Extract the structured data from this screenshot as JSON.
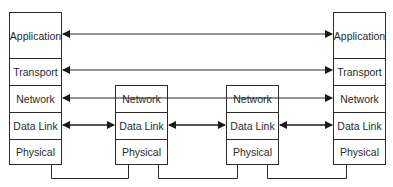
{
  "diagram": {
    "type": "protocol-stack-routing",
    "colors": {
      "line": "#2a2a2a",
      "text": "#2a2a2a",
      "background": "#ffffff"
    },
    "end_hosts": {
      "left": {
        "layers": [
          "Application",
          "Transport",
          "Network",
          "Data Link",
          "Physical"
        ]
      },
      "right": {
        "layers": [
          "Application",
          "Transport",
          "Network",
          "Data Link",
          "Physical"
        ]
      }
    },
    "routers": [
      {
        "layers": [
          "Network",
          "Data Link",
          "Physical"
        ]
      },
      {
        "layers": [
          "Network",
          "Data Link",
          "Physical"
        ]
      }
    ],
    "connections": [
      {
        "layer": "Application",
        "from": "left-host",
        "to": "right-host",
        "style": "double-arrow"
      },
      {
        "layer": "Transport",
        "from": "left-host",
        "to": "right-host",
        "style": "double-arrow"
      },
      {
        "layer": "Network",
        "from": "left-host",
        "to": "right-host",
        "style": "double-arrow",
        "passes_through": [
          "router-1",
          "router-2"
        ]
      },
      {
        "layer": "Data Link",
        "from": "left-host",
        "to": "router-1",
        "style": "double-arrow"
      },
      {
        "layer": "Data Link",
        "from": "router-1",
        "to": "router-2",
        "style": "double-arrow"
      },
      {
        "layer": "Data Link",
        "from": "router-2",
        "to": "right-host",
        "style": "double-arrow"
      },
      {
        "layer": "Physical",
        "from": "left-host",
        "to": "router-1",
        "style": "cable"
      },
      {
        "layer": "Physical",
        "from": "router-1",
        "to": "router-2",
        "style": "cable"
      },
      {
        "layer": "Physical",
        "from": "router-2",
        "to": "right-host",
        "style": "cable"
      }
    ]
  }
}
